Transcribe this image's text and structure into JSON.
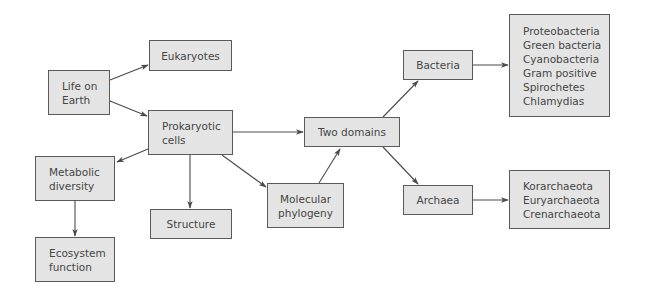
{
  "diagram": {
    "type": "concept-map",
    "colors": {
      "box_fill": "#e4e4e4",
      "box_border": "#5a5a5a",
      "text": "#454545",
      "arrow": "#4a4a4a"
    },
    "nodes": {
      "life_on_earth": {
        "lines": [
          "Life on",
          "Earth"
        ]
      },
      "eukaryotes": {
        "lines": [
          "Eukaryotes"
        ]
      },
      "prokaryotic_cells": {
        "lines": [
          "Prokaryotic",
          "cells"
        ]
      },
      "metabolic_diversity": {
        "lines": [
          "Metabolic",
          "diversity"
        ]
      },
      "ecosystem_function": {
        "lines": [
          "Ecosystem",
          "function"
        ]
      },
      "structure": {
        "lines": [
          "Structure"
        ]
      },
      "molecular_phylogeny": {
        "lines": [
          "Molecular",
          "phylogeny"
        ]
      },
      "two_domains": {
        "lines": [
          "Two domains"
        ]
      },
      "bacteria": {
        "lines": [
          "Bacteria"
        ]
      },
      "archaea": {
        "lines": [
          "Archaea"
        ]
      },
      "bacteria_groups": {
        "lines": [
          "Proteobacteria",
          "Green bacteria",
          "Cyanobacteria",
          "Gram positive",
          "Spirochetes",
          "Chlamydias"
        ]
      },
      "archaea_groups": {
        "lines": [
          "Korarchaeota",
          "Euryarchaeota",
          "Crenarchaeota"
        ]
      }
    },
    "edges": [
      {
        "from": "Life on Earth",
        "to": "Eukaryotes"
      },
      {
        "from": "Life on Earth",
        "to": "Prokaryotic cells"
      },
      {
        "from": "Prokaryotic cells",
        "to": "Metabolic diversity"
      },
      {
        "from": "Prokaryotic cells",
        "to": "Structure"
      },
      {
        "from": "Prokaryotic cells",
        "to": "Molecular phylogeny"
      },
      {
        "from": "Prokaryotic cells",
        "to": "Two domains"
      },
      {
        "from": "Metabolic diversity",
        "to": "Ecosystem function"
      },
      {
        "from": "Molecular phylogeny",
        "to": "Two domains"
      },
      {
        "from": "Two domains",
        "to": "Bacteria"
      },
      {
        "from": "Two domains",
        "to": "Archaea"
      },
      {
        "from": "Bacteria",
        "to": "Bacteria groups"
      },
      {
        "from": "Archaea",
        "to": "Archaea groups"
      }
    ]
  }
}
